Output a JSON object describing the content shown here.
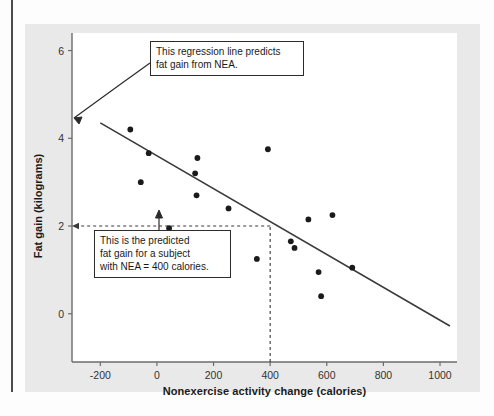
{
  "figure": {
    "kind": "scatterplot-with-regression-line"
  },
  "annotations": {
    "regression_callout": {
      "line1": "This regression line predicts",
      "line2": "fat gain from NEA."
    },
    "prediction_callout": {
      "line1": "This is the predicted",
      "line2": "fat gain for a subject",
      "line3": "with NEA = 400 calories."
    }
  },
  "chart_data": {
    "type": "scatter",
    "title": "",
    "xlabel": "Nonexercise activity change (calories)",
    "ylabel": "Fat gain (kilograms)",
    "xlim": [
      -300,
      1060
    ],
    "ylim": [
      -1.1,
      6.4
    ],
    "xticks": [
      -200,
      0,
      200,
      400,
      600,
      800,
      1000
    ],
    "xticklabels": [
      "-200",
      "0",
      "200",
      "400",
      "600",
      "800",
      "1000"
    ],
    "yticks": [
      0,
      2,
      4,
      6
    ],
    "yticklabels": [
      "0",
      "2",
      "4",
      "6"
    ],
    "grid": false,
    "legend": null,
    "series": [
      {
        "name": "Subjects",
        "marker": "filled-circle",
        "color": "#1a1a1a",
        "points": [
          {
            "x": -94,
            "y": 4.2
          },
          {
            "x": -57,
            "y": 3.0
          },
          {
            "x": -29,
            "y": 3.66
          },
          {
            "x": 43,
            "y": 1.95
          },
          {
            "x": 135,
            "y": 3.2
          },
          {
            "x": 143,
            "y": 3.55
          },
          {
            "x": 140,
            "y": 2.7
          },
          {
            "x": 253,
            "y": 2.4
          },
          {
            "x": 353,
            "y": 1.25
          },
          {
            "x": 392,
            "y": 3.75
          },
          {
            "x": 473,
            "y": 1.65
          },
          {
            "x": 486,
            "y": 1.5
          },
          {
            "x": 535,
            "y": 2.15
          },
          {
            "x": 571,
            "y": 0.95
          },
          {
            "x": 580,
            "y": 0.4
          },
          {
            "x": 620,
            "y": 2.25
          },
          {
            "x": 690,
            "y": 1.05
          }
        ]
      }
    ],
    "regression_line": {
      "name": "Least-squares regression line",
      "color": "#3a3a3a",
      "x_start": -200,
      "y_start": 4.35,
      "x_end": 1035,
      "y_end": -0.28
    },
    "prediction_guides": {
      "color": "#3a3a3a",
      "style": "dashed",
      "x_value": 400,
      "y_value": 2.0,
      "description": "Dashed guides from x = 400 up to the line and across to y = 2"
    }
  }
}
